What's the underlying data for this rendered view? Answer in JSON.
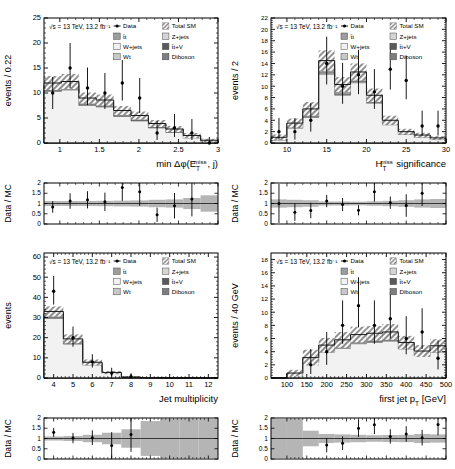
{
  "figure": {
    "kind": "four-panel-hep-distribution",
    "common_label": "√s = 13 TeV, 13.2 fb⁻¹",
    "ratio_axis_label": "Data / MC",
    "ratio_ticks": [
      "0",
      "0.5",
      "1",
      "1.5",
      "2"
    ],
    "legend": [
      {
        "key": "data",
        "label": "Data",
        "marker": "point-with-errorbar",
        "color": "#000000"
      },
      {
        "key": "total_sm",
        "label": "Total SM",
        "marker": "hatch-swatch",
        "color": "#9a9a9a"
      },
      {
        "key": "ttbar",
        "label": "t̄t",
        "marker": "swatch",
        "color": "#9d9d9d"
      },
      {
        "key": "zjets",
        "label": "Z+jets",
        "marker": "swatch",
        "color": "#d5d5d5"
      },
      {
        "key": "wjets",
        "label": "W+jets",
        "marker": "swatch",
        "color": "#f2f2f2"
      },
      {
        "key": "ttv",
        "label": "t̄t+V",
        "marker": "swatch",
        "color": "#5a5a5a"
      },
      {
        "key": "wt",
        "label": "Wt",
        "marker": "swatch",
        "color": "#c8c8c8"
      },
      {
        "key": "diboson",
        "label": "Diboson",
        "marker": "swatch",
        "color": "#7e7e7e"
      }
    ]
  },
  "chart_data": [
    {
      "id": "min_dphi",
      "type": "bar",
      "title": "",
      "xlabel": "min Δφ(E_T^miss , j)",
      "xlabel_parts": {
        "pre": "min Δφ(E",
        "sub": "T",
        "sup": "miss",
        "post": ", j)"
      },
      "ylabel": "events / 0.22",
      "xlim": [
        0.8,
        3.0
      ],
      "ylim": [
        0,
        25
      ],
      "xticks": [
        "1",
        "1.5",
        "2",
        "2.5",
        "3"
      ],
      "xtick_values": [
        1,
        1.5,
        2,
        2.5,
        3
      ],
      "yticks": [
        "0",
        "5",
        "10",
        "15",
        "20",
        "25"
      ],
      "ytick_values": [
        0,
        5,
        10,
        15,
        20,
        25
      ],
      "bin_edges": [
        0.8,
        1.02,
        1.24,
        1.46,
        1.68,
        1.9,
        2.12,
        2.34,
        2.56,
        2.78,
        3.0
      ],
      "series": [
        {
          "name": "W+jets",
          "values": [
            10.3,
            10.6,
            7.5,
            7.2,
            5.3,
            4.4,
            3.0,
            2.1,
            1.0,
            0.35
          ]
        },
        {
          "name": "Z+jets",
          "values": [
            0.2,
            0.2,
            0.15,
            0.15,
            0.1,
            0.1,
            0.08,
            0.05,
            0.03,
            0.02
          ]
        },
        {
          "name": "t̄t",
          "values": [
            0.9,
            0.9,
            0.8,
            0.7,
            0.7,
            0.6,
            0.5,
            0.4,
            0.3,
            0.1
          ]
        },
        {
          "name": "Wt",
          "values": [
            0.2,
            0.2,
            0.2,
            0.2,
            0.15,
            0.15,
            0.1,
            0.1,
            0.05,
            0.02
          ]
        },
        {
          "name": "t̄t+V",
          "values": [
            0.1,
            0.1,
            0.1,
            0.1,
            0.08,
            0.08,
            0.05,
            0.05,
            0.02,
            0.01
          ]
        },
        {
          "name": "Diboson",
          "values": [
            0.3,
            0.3,
            0.25,
            0.25,
            0.2,
            0.2,
            0.15,
            0.1,
            0.1,
            0.05
          ]
        }
      ],
      "total_sm": [
        12.0,
        12.3,
        9.0,
        8.6,
        6.5,
        5.5,
        3.9,
        2.8,
        1.5,
        0.55
      ],
      "total_sm_err": [
        1.4,
        1.5,
        1.1,
        1.1,
        0.9,
        0.8,
        0.7,
        0.6,
        0.5,
        0.3
      ],
      "data": {
        "x": [
          0.91,
          1.13,
          1.35,
          1.57,
          1.79,
          2.01,
          2.23,
          2.45,
          2.67,
          2.89
        ],
        "y": [
          10,
          15,
          11,
          10,
          12,
          9,
          2,
          3,
          2,
          0
        ],
        "yerr_lo": [
          3.2,
          4.0,
          3.4,
          3.2,
          3.5,
          3.0,
          1.4,
          1.8,
          1.4,
          0.0
        ],
        "yerr_hi": [
          3.2,
          5.0,
          4.1,
          4.0,
          4.6,
          4.0,
          2.4,
          2.8,
          2.8,
          1.2
        ]
      },
      "ratio": {
        "x": [
          0.91,
          1.13,
          1.35,
          1.57,
          1.79,
          2.01,
          2.23,
          2.45,
          2.67
        ],
        "y": [
          0.83,
          1.12,
          1.18,
          1.08,
          1.78,
          1.57,
          0.45,
          0.89,
          1.22
        ],
        "yerr": [
          0.28,
          0.38,
          0.42,
          0.45,
          0.65,
          0.68,
          0.35,
          0.62,
          0.85
        ],
        "band": [
          0.12,
          0.12,
          0.12,
          0.13,
          0.14,
          0.15,
          0.18,
          0.2,
          0.27,
          0.4
        ]
      }
    },
    {
      "id": "htmiss_sig",
      "type": "bar",
      "title": "",
      "xlabel": "H_T^miss significance",
      "xlabel_parts": {
        "pre": "H",
        "sub": "T",
        "sup": "miss",
        "post": " significance"
      },
      "ylabel": "events / 2",
      "xlim": [
        8,
        30
      ],
      "ylim": [
        0,
        22
      ],
      "xticks": [
        "10",
        "15",
        "20",
        "25",
        "30"
      ],
      "xtick_values": [
        10,
        15,
        20,
        25,
        30
      ],
      "yticks": [
        "0",
        "2",
        "4",
        "6",
        "8",
        "10",
        "12",
        "14",
        "16",
        "18",
        "20",
        "22"
      ],
      "ytick_values": [
        0,
        2,
        4,
        6,
        8,
        10,
        12,
        14,
        16,
        18,
        20,
        22
      ],
      "bin_edges": [
        8,
        10,
        12,
        14,
        16,
        18,
        20,
        22,
        24,
        26,
        28,
        30
      ],
      "series": [
        {
          "name": "W+jets",
          "values": [
            0.5,
            2.6,
            4.5,
            12.1,
            8.4,
            10.6,
            7.0,
            3.2,
            1.5,
            1.0,
            0.6
          ]
        },
        {
          "name": "Z+jets",
          "values": [
            0.05,
            0.1,
            0.1,
            0.2,
            0.15,
            0.2,
            0.15,
            0.08,
            0.05,
            0.05,
            0.03
          ]
        },
        {
          "name": "t̄t",
          "values": [
            0.2,
            0.4,
            0.7,
            1.3,
            1.0,
            1.0,
            0.7,
            0.4,
            0.3,
            0.2,
            0.15
          ]
        },
        {
          "name": "Wt",
          "values": [
            0.05,
            0.1,
            0.15,
            0.25,
            0.2,
            0.2,
            0.15,
            0.1,
            0.05,
            0.05,
            0.02
          ]
        },
        {
          "name": "t̄t+V",
          "values": [
            0.05,
            0.05,
            0.1,
            0.1,
            0.1,
            0.1,
            0.08,
            0.05,
            0.03,
            0.02,
            0.02
          ]
        },
        {
          "name": "Diboson",
          "values": [
            0.15,
            0.25,
            0.45,
            0.55,
            0.45,
            0.4,
            0.3,
            0.17,
            0.1,
            0.08,
            0.08
          ]
        }
      ],
      "total_sm": [
        1.0,
        3.5,
        6.0,
        14.5,
        10.3,
        12.5,
        8.4,
        4.0,
        2.0,
        1.4,
        0.9
      ],
      "total_sm_err": [
        0.5,
        0.8,
        1.2,
        1.8,
        1.3,
        1.5,
        1.2,
        0.8,
        0.5,
        0.4,
        0.3
      ],
      "data": {
        "x": [
          9,
          11,
          13,
          15,
          17,
          19,
          21,
          23,
          25,
          27,
          29
        ],
        "y": [
          2,
          2,
          4,
          14,
          10,
          12,
          9,
          13,
          11,
          3,
          3
        ],
        "yerr_lo": [
          1.4,
          1.4,
          2.0,
          3.7,
          3.1,
          3.4,
          3.0,
          3.6,
          3.3,
          1.7,
          1.7
        ],
        "yerr_hi": [
          2.4,
          2.4,
          3.0,
          4.7,
          4.1,
          4.4,
          4.0,
          4.6,
          4.3,
          2.7,
          2.7
        ]
      },
      "ratio": {
        "x": [
          9,
          11,
          13,
          15,
          17,
          19,
          21,
          23,
          25,
          27
        ],
        "y": [
          1.0,
          0.57,
          0.66,
          1.12,
          0.95,
          0.67,
          1.57,
          1.04,
          0.9,
          1.5
        ],
        "yerr": [
          0.95,
          0.42,
          0.38,
          0.3,
          0.32,
          0.25,
          0.48,
          0.3,
          0.55,
          0.62
        ],
        "band": [
          0.2,
          0.18,
          0.16,
          0.1,
          0.1,
          0.09,
          0.11,
          0.13,
          0.16,
          0.2,
          0.22
        ]
      }
    },
    {
      "id": "jet_multiplicity",
      "type": "bar",
      "title": "",
      "xlabel": "Jet multiplicity",
      "xlabel_parts": {
        "pre": "Jet multiplicity",
        "sub": "",
        "sup": "",
        "post": ""
      },
      "ylabel": "events",
      "xlim": [
        3.5,
        12.5
      ],
      "ylim": [
        0,
        62
      ],
      "xticks": [
        "4",
        "5",
        "6",
        "7",
        "8",
        "9",
        "10",
        "11",
        "12"
      ],
      "xtick_values": [
        4,
        5,
        6,
        7,
        8,
        9,
        10,
        11,
        12
      ],
      "yticks": [
        "0",
        "10",
        "20",
        "30",
        "40",
        "50",
        "60"
      ],
      "ytick_values": [
        0,
        10,
        20,
        30,
        40,
        50,
        60
      ],
      "bin_edges": [
        3.5,
        4.5,
        5.5,
        6.5,
        7.5,
        8.5,
        9.5,
        10.5,
        11.5,
        12.5
      ],
      "series": [
        {
          "name": "W+jets",
          "values": [
            29.5,
            16.8,
            6.4,
            2.3,
            0.3,
            0.05,
            0.0,
            0.0,
            0.0
          ]
        },
        {
          "name": "Z+jets",
          "values": [
            0.5,
            0.3,
            0.1,
            0.05,
            0.01,
            0.0,
            0.0,
            0.0,
            0.0
          ]
        },
        {
          "name": "t̄t",
          "values": [
            1.6,
            1.2,
            0.7,
            0.2,
            0.05,
            0.0,
            0.0,
            0.0,
            0.0
          ]
        },
        {
          "name": "Wt",
          "values": [
            0.3,
            0.3,
            0.15,
            0.05,
            0.01,
            0.0,
            0.0,
            0.0,
            0.0
          ]
        },
        {
          "name": "t̄t+V",
          "values": [
            0.2,
            0.15,
            0.1,
            0.03,
            0.01,
            0.0,
            0.0,
            0.0,
            0.0
          ]
        },
        {
          "name": "Diboson",
          "values": [
            0.9,
            0.65,
            0.35,
            0.07,
            0.02,
            0.0,
            0.0,
            0.0,
            0.0
          ]
        }
      ],
      "total_sm": [
        33.0,
        19.4,
        7.8,
        2.7,
        0.4,
        0.05,
        0.0,
        0.0,
        0.0
      ],
      "total_sm_err": [
        2.5,
        2.2,
        1.4,
        0.8,
        0.25,
        0.05,
        0.0,
        0.0,
        0.0
      ],
      "data": {
        "x": [
          4,
          5,
          6,
          7,
          8,
          9,
          10,
          11,
          12
        ],
        "y": [
          43,
          20,
          8,
          2.5,
          0.6,
          0,
          0,
          0,
          0
        ],
        "yerr_lo": [
          6.6,
          4.5,
          2.8,
          1.6,
          0.6,
          0,
          0,
          0,
          0
        ],
        "yerr_hi": [
          7.6,
          5.5,
          3.8,
          2.6,
          1.8,
          0,
          0,
          0,
          0
        ]
      },
      "ratio": {
        "x": [
          4,
          5,
          6,
          7,
          8
        ],
        "y": [
          1.3,
          1.02,
          1.04,
          0.66,
          1.2
        ],
        "yerr": [
          0.22,
          0.25,
          0.36,
          0.65,
          0.85
        ],
        "band": [
          0.1,
          0.12,
          0.18,
          0.28,
          0.45,
          0.85,
          0.95,
          0.95,
          0.95
        ]
      }
    },
    {
      "id": "first_jet_pt",
      "type": "bar",
      "title": "",
      "xlabel": "first jet p_T [GeV]",
      "xlabel_parts": {
        "pre": "first jet p",
        "sub": "T",
        "sup": "",
        "post": " [GeV]"
      },
      "ylabel": "events / 40 GeV",
      "xlim": [
        60,
        500
      ],
      "ylim": [
        0,
        19
      ],
      "xticks": [
        "100",
        "150",
        "200",
        "250",
        "300",
        "350",
        "400",
        "450",
        "500"
      ],
      "xtick_values": [
        100,
        150,
        200,
        250,
        300,
        350,
        400,
        450,
        500
      ],
      "yticks": [
        "0",
        "2",
        "4",
        "6",
        "8",
        "10",
        "12",
        "14",
        "16",
        "18"
      ],
      "ytick_values": [
        0,
        2,
        4,
        6,
        8,
        10,
        12,
        14,
        16,
        18
      ],
      "bin_edges": [
        60,
        100,
        140,
        180,
        220,
        260,
        300,
        340,
        380,
        420,
        460,
        500
      ],
      "series": [
        {
          "name": "W+jets",
          "values": [
            0.0,
            0.5,
            2.3,
            3.9,
            4.5,
            5.2,
            5.4,
            5.6,
            4.4,
            3.3,
            3.9
          ]
        },
        {
          "name": "Z+jets",
          "values": [
            0.0,
            0.02,
            0.08,
            0.1,
            0.12,
            0.12,
            0.12,
            0.12,
            0.08,
            0.07,
            0.07
          ]
        },
        {
          "name": "t̄t",
          "values": [
            0.0,
            0.1,
            0.3,
            0.5,
            0.6,
            0.7,
            0.7,
            0.7,
            0.5,
            0.4,
            0.5
          ]
        },
        {
          "name": "Wt",
          "values": [
            0.0,
            0.03,
            0.1,
            0.12,
            0.15,
            0.15,
            0.15,
            0.15,
            0.1,
            0.08,
            0.1
          ]
        },
        {
          "name": "t̄t+V",
          "values": [
            0.0,
            0.02,
            0.05,
            0.06,
            0.08,
            0.08,
            0.08,
            0.08,
            0.05,
            0.04,
            0.05
          ]
        },
        {
          "name": "Diboson",
          "values": [
            0.0,
            0.08,
            0.27,
            0.32,
            0.35,
            0.35,
            0.35,
            0.35,
            0.27,
            0.21,
            0.28
          ]
        }
      ],
      "total_sm": [
        0.0,
        0.75,
        3.1,
        5.0,
        5.8,
        6.6,
        6.8,
        7.0,
        5.4,
        4.1,
        4.9
      ],
      "total_sm_err": [
        0.0,
        0.5,
        1.2,
        1.1,
        1.2,
        1.2,
        1.1,
        1.2,
        1.0,
        0.9,
        1.0
      ],
      "data": {
        "x": [
          80,
          120,
          160,
          200,
          240,
          280,
          320,
          360,
          400,
          440,
          480
        ],
        "y": [
          0,
          0,
          2,
          4,
          8,
          11,
          8,
          9,
          6,
          7,
          3
        ],
        "yerr_lo": [
          0,
          0,
          1.4,
          2.0,
          2.8,
          3.3,
          2.8,
          3.0,
          2.4,
          2.6,
          1.7
        ],
        "yerr_hi": [
          0,
          0,
          2.4,
          3.0,
          3.8,
          4.3,
          3.8,
          4.0,
          3.4,
          3.6,
          2.7
        ]
      },
      "ratio": {
        "x": [
          200,
          240,
          280,
          320,
          360,
          400,
          440,
          480
        ],
        "y": [
          0.68,
          0.77,
          1.5,
          1.67,
          1.1,
          1.22,
          1.04,
          1.68,
          0.58
        ],
        "yerr": [
          0.35,
          0.33,
          0.42,
          0.45,
          0.35,
          0.38,
          0.38,
          0.52,
          0.35
        ],
        "band": [
          0.95,
          0.95,
          0.38,
          0.22,
          0.2,
          0.18,
          0.16,
          0.17,
          0.18,
          0.22,
          0.2
        ]
      }
    }
  ]
}
